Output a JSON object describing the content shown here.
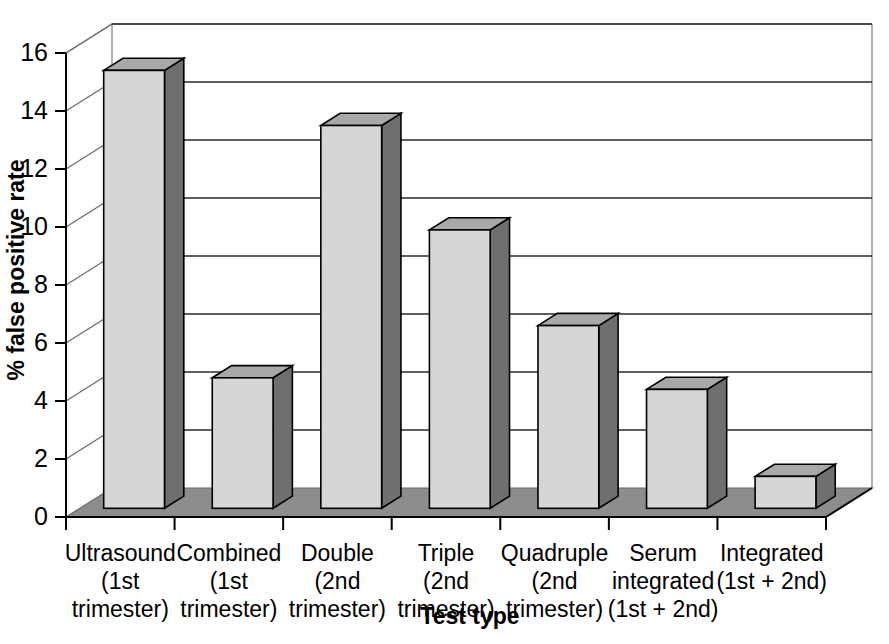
{
  "chart_data": {
    "type": "bar",
    "title": "",
    "subtitle": "",
    "xlabel": "Test type",
    "ylabel": "% false positive rate",
    "categories": [
      "Ultrasound (1st trimester)",
      "Combined (1st trimester)",
      "Double (2nd trimester)",
      "Triple (2nd trimester)",
      "Quadruple (2nd trimester)",
      "Serum integrated (1st + 2nd)",
      "Integrated (1st + 2nd)"
    ],
    "category_lines": [
      [
        "Ultrasound",
        "(1st",
        "trimester)"
      ],
      [
        "Combined",
        "(1st",
        "trimester)"
      ],
      [
        "Double",
        "(2nd",
        "trimester)"
      ],
      [
        "Triple",
        "(2nd",
        "trimester)"
      ],
      [
        "Quadruple",
        "(2nd",
        "trimester)"
      ],
      [
        "Serum",
        "integrated",
        "(1st + 2nd)"
      ],
      [
        "Integrated",
        "(1st + 2nd)",
        ""
      ]
    ],
    "values": [
      15.1,
      4.5,
      13.2,
      9.6,
      6.3,
      4.1,
      1.1
    ],
    "ylim": [
      0,
      16
    ],
    "yticks": [
      0,
      2,
      4,
      6,
      8,
      10,
      12,
      14,
      16
    ],
    "ytick_labels": [
      "0",
      "2",
      "4",
      "6",
      "8",
      "10",
      "12",
      "14",
      "16"
    ],
    "grid": true,
    "legend": "none",
    "style": "3d-column",
    "colors": {
      "bar_front": "#d6d6d6",
      "bar_side": "#6f6f6f",
      "bar_top": "#a8a8a8",
      "floor": "#8d8d8d",
      "floor_edge": "#6a6a6a",
      "gridline": "#2b2b2b",
      "axis": "#000000",
      "background": "#ffffff"
    }
  }
}
